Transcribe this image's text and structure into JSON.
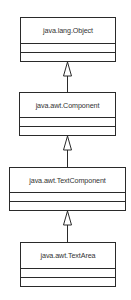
{
  "diagram": {
    "type": "uml-class-inheritance",
    "classes": [
      {
        "name": "java.lang.Object"
      },
      {
        "name": "java.awt.Component"
      },
      {
        "name": "java.awt.TextComponent"
      },
      {
        "name": "java.awt.TextArea"
      }
    ],
    "relationships": [
      {
        "from": "java.awt.Component",
        "to": "java.lang.Object",
        "kind": "generalization"
      },
      {
        "from": "java.awt.TextComponent",
        "to": "java.awt.Component",
        "kind": "generalization"
      },
      {
        "from": "java.awt.TextArea",
        "to": "java.awt.TextComponent",
        "kind": "generalization"
      }
    ],
    "colors": {
      "line": "#2a2a2a",
      "text": "#333333",
      "background": "#ffffff"
    }
  }
}
